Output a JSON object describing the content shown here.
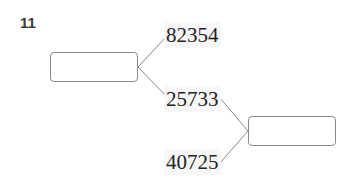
{
  "question": {
    "number": "11"
  },
  "diagram": {
    "left_box": {
      "value": ""
    },
    "right_box": {
      "value": ""
    },
    "numbers": [
      {
        "label": "82354"
      },
      {
        "label": "25733"
      },
      {
        "label": "40725"
      }
    ],
    "line_color": "#8a8a8a"
  }
}
